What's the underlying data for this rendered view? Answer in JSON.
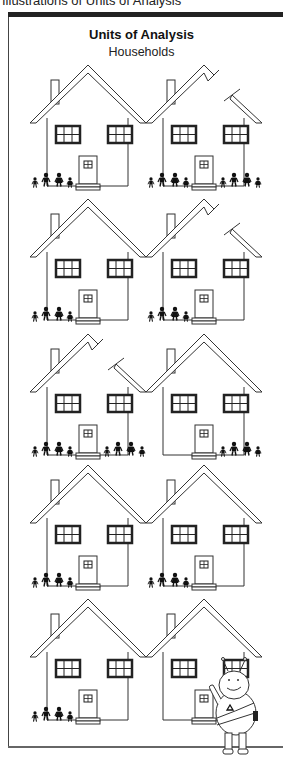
{
  "caption": "Illustrations of Units of Analysis",
  "figure": {
    "title": "Units of Analysis",
    "subtitle": "Households"
  },
  "houses": [
    {
      "row": 0,
      "col": 0,
      "roof": "whole",
      "families": [
        "left"
      ]
    },
    {
      "row": 0,
      "col": 1,
      "roof": "split",
      "families": [
        "left",
        "right"
      ]
    },
    {
      "row": 1,
      "col": 0,
      "roof": "whole",
      "families": [
        "left"
      ]
    },
    {
      "row": 1,
      "col": 1,
      "roof": "split",
      "families": [
        "left"
      ]
    },
    {
      "row": 2,
      "col": 0,
      "roof": "split",
      "families": [
        "left",
        "right"
      ]
    },
    {
      "row": 2,
      "col": 1,
      "roof": "whole",
      "families": [
        "right"
      ]
    },
    {
      "row": 3,
      "col": 0,
      "roof": "whole",
      "families": [
        "left"
      ]
    },
    {
      "row": 3,
      "col": 1,
      "roof": "whole",
      "families": [
        "left"
      ]
    },
    {
      "row": 4,
      "col": 0,
      "roof": "whole",
      "families": [
        "left"
      ]
    },
    {
      "row": 4,
      "col": 1,
      "roof": "whole",
      "families": [],
      "mascot": "bee-mascot"
    }
  ],
  "colors": {
    "line": "#333333",
    "window": "#222222",
    "figure": "#111111"
  }
}
